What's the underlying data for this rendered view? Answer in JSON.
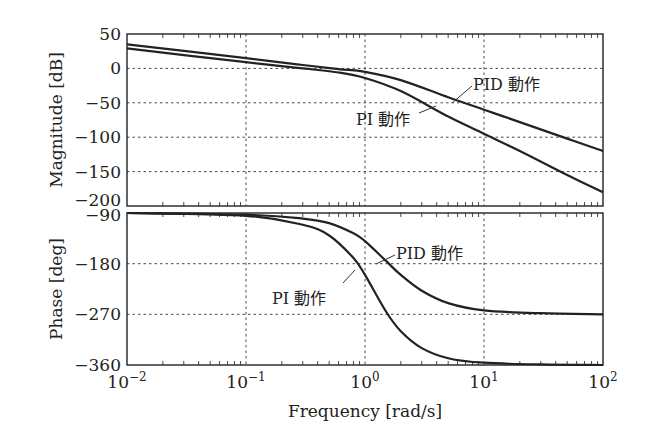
{
  "chart_data": [
    {
      "type": "line",
      "title": "",
      "xlabel": "",
      "ylabel": "Magnitude [dB]",
      "xscale": "log",
      "xlim": [
        0.01,
        100
      ],
      "ylim": [
        -200,
        50
      ],
      "yticks": [
        50,
        0,
        -50,
        -100,
        -150,
        -200
      ],
      "ytick_labels": [
        "50",
        "0",
        "−50",
        "−100",
        "−150",
        "−200"
      ],
      "grid": true,
      "x": [
        0.01,
        0.1,
        0.3,
        0.6,
        1,
        2,
        5,
        10,
        20,
        50,
        100
      ],
      "series": [
        {
          "name": "PID 動作",
          "values": [
            35,
            15,
            5,
            -1,
            -5,
            -17,
            -42,
            -60,
            -78,
            -102,
            -120
          ]
        },
        {
          "name": "PI 動作",
          "values": [
            29,
            9,
            0,
            -6,
            -14,
            -33,
            -70,
            -95,
            -120,
            -155,
            -180
          ]
        }
      ],
      "annotations": [
        {
          "text": "PID 動作",
          "target_series": "PID 動作"
        },
        {
          "text": "PI 動作",
          "target_series": "PI 動作"
        }
      ]
    },
    {
      "type": "line",
      "title": "",
      "xlabel": "Frequency [rad/s]",
      "ylabel": "Phase [deg]",
      "xscale": "log",
      "xlim": [
        0.01,
        100
      ],
      "ylim": [
        -360,
        -90
      ],
      "yticks": [
        -90,
        -180,
        -270,
        -360
      ],
      "ytick_labels": [
        "−90",
        "−180",
        "−270",
        "−360"
      ],
      "xticks": [
        0.01,
        0.1,
        1,
        10,
        100
      ],
      "xtick_labels": [
        "10^-2",
        "10^-1",
        "10^0",
        "10^1",
        "10^2"
      ],
      "grid": true,
      "x": [
        0.01,
        0.1,
        0.3,
        0.5,
        0.8,
        1,
        1.5,
        2,
        3,
        5,
        10,
        30,
        100
      ],
      "series": [
        {
          "name": "PID 動作",
          "values": [
            -90,
            -93,
            -100,
            -108,
            -126,
            -140,
            -175,
            -200,
            -228,
            -250,
            -263,
            -268,
            -270
          ]
        },
        {
          "name": "PI 動作",
          "values": [
            -90,
            -95,
            -111,
            -130,
            -170,
            -200,
            -265,
            -300,
            -330,
            -348,
            -356,
            -359,
            -360
          ]
        }
      ],
      "annotations": [
        {
          "text": "PID 動作",
          "target_series": "PID 動作"
        },
        {
          "text": "PI 動作",
          "target_series": "PI 動作"
        }
      ]
    }
  ],
  "labels": {
    "mag_ylabel": "Magnitude [dB]",
    "phase_ylabel": "Phase [deg]",
    "xlabel": "Frequency [rad/s]",
    "anno_pid_mag": "PID 動作",
    "anno_pi_mag": "PI 動作",
    "anno_pid_phase": "PID 動作",
    "anno_pi_phase": "PI 動作",
    "mag_ticks": [
      "50",
      "0",
      "−50",
      "−100",
      "−150",
      "−200"
    ],
    "phase_ticks": [
      "−90",
      "−180",
      "−270",
      "−360"
    ],
    "x_tick_base": "10",
    "x_tick_exps": [
      "−2",
      "−1",
      "0",
      "1",
      "2"
    ]
  }
}
